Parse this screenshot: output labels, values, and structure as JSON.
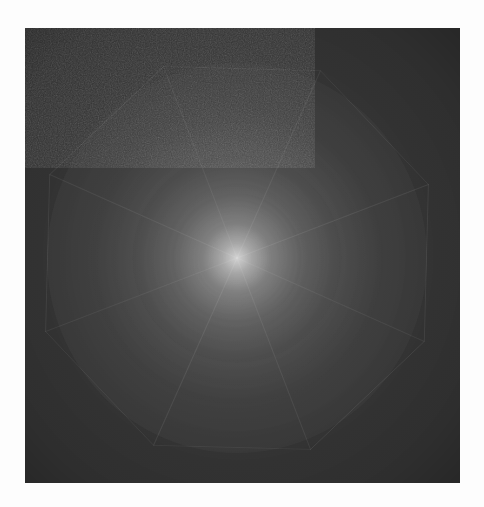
{
  "image": {
    "kind": "raster-photograph",
    "subject_name": "eight-point-pinwheel-star",
    "alt_text": "Glowing eight-pointed pinwheel star with mesh texture on a dark gray square",
    "width": 484,
    "height": 507
  },
  "page": {
    "background_color": "#fdfdfd"
  },
  "canvas": {
    "name": "dark-square-plate",
    "x": 25,
    "y": 28,
    "width": 435,
    "height": 455,
    "background_color": "#343434",
    "grain": "film-grain",
    "grain_opacity": 0.4
  },
  "figure": {
    "name": "radial-star-figure",
    "type": "pinwheel-star",
    "points": 8,
    "center_x": 237,
    "center_y": 258,
    "outer_radius": 205,
    "inner_radius": 96,
    "twist_degrees": 26,
    "rotation_offset_degrees": -8,
    "core_color": "#f2f2f2",
    "mid_color": "#9a9a9a",
    "edge_color": "#5a5a5a",
    "background_color": "#343434",
    "texture": "woven-mesh-moire-grid",
    "mesh_angle_a_degrees": 27,
    "mesh_angle_b_degrees": 117,
    "mesh_pitch_px": 3,
    "glow": "central-radial-highlight",
    "tips": [
      {
        "label": "tip-1-top",
        "x": 160,
        "y": 50
      },
      {
        "label": "tip-2-top-right",
        "x": 325,
        "y": 48
      },
      {
        "label": "tip-3-right-upper",
        "x": 440,
        "y": 190
      },
      {
        "label": "tip-4-right-lower",
        "x": 425,
        "y": 335
      },
      {
        "label": "tip-5-bottom-right",
        "x": 305,
        "y": 460
      },
      {
        "label": "tip-6-bottom-left",
        "x": 158,
        "y": 453
      },
      {
        "label": "tip-7-left-lower",
        "x": 60,
        "y": 310
      },
      {
        "label": "tip-8-left-upper",
        "x": 43,
        "y": 163
      }
    ]
  }
}
